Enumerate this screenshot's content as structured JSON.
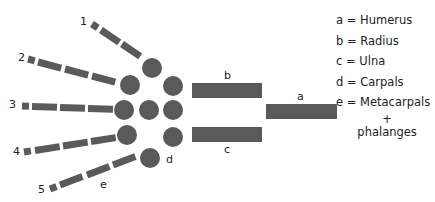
{
  "diagram": {
    "colors": {
      "bone": "#5a5a5a",
      "text": "#222222",
      "background": "#ffffff"
    },
    "digit_labels": [
      "1",
      "2",
      "3",
      "4",
      "5"
    ],
    "bone_labels": {
      "a": "a",
      "b": "b",
      "c": "c",
      "d": "d",
      "e": "e"
    }
  },
  "legend": {
    "items": [
      {
        "key": "a",
        "text": "a = Humerus"
      },
      {
        "key": "b",
        "text": "b = Radius"
      },
      {
        "key": "c",
        "text": "c = Ulna"
      },
      {
        "key": "d",
        "text": "d = Carpals"
      },
      {
        "key": "e",
        "text": "e = Metacarpals"
      }
    ],
    "continuation_plus": "+",
    "continuation_text": "phalanges"
  }
}
